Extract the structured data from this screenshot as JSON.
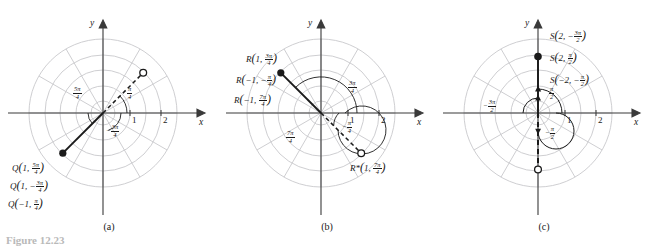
{
  "figure": {
    "caption": "Figure 12.23",
    "panels": [
      {
        "id": "a",
        "caption": "(a)",
        "axis": {
          "x_label": "x",
          "y_label": "y",
          "ticks": [
            "1",
            "2"
          ]
        },
        "angle_labels": [
          {
            "name": "five-pi-over-four",
            "sign": "",
            "num": "5π",
            "den": "4"
          },
          {
            "name": "pi-over-four",
            "sign": "",
            "num": "π",
            "den": "4"
          },
          {
            "name": "neg-three-pi-over-four",
            "sign": "−",
            "num": "3π",
            "den": "4"
          }
        ],
        "point_labels": [
          {
            "name": "Q",
            "r": "1",
            "sign": "",
            "num": "5π",
            "den": "4"
          },
          {
            "name": "Q",
            "r": "1",
            "sign": "−",
            "num": "3π",
            "den": "4"
          },
          {
            "name": "Q",
            "r": "−1",
            "sign": "",
            "num": "π",
            "den": "4"
          }
        ],
        "markers": [
          {
            "kind": "filled",
            "r": 1,
            "theta_deg": 225
          },
          {
            "kind": "open",
            "r": 1,
            "theta_deg": 45
          }
        ]
      },
      {
        "id": "b",
        "caption": "(b)",
        "axis": {
          "x_label": "x",
          "y_label": "y",
          "ticks": [
            "1",
            "2"
          ]
        },
        "angle_labels": [
          {
            "name": "three-pi-over-four",
            "sign": "",
            "num": "3π",
            "den": "4"
          },
          {
            "name": "seven-pi-over-four",
            "sign": "",
            "num": "7π",
            "den": "4"
          },
          {
            "name": "neg-pi-over-four",
            "sign": "−",
            "num": "π",
            "den": "4"
          }
        ],
        "point_labels": [
          {
            "name": "R",
            "r": "1",
            "sign": "",
            "num": "3π",
            "den": "4"
          },
          {
            "name": "R",
            "r": "−1",
            "sign": "−",
            "num": "π",
            "den": "4"
          },
          {
            "name": "R",
            "r": "−1",
            "sign": "",
            "num": "7π",
            "den": "4"
          },
          {
            "name": "R*",
            "r": "1",
            "sign": "",
            "num": "7π",
            "den": "4"
          }
        ],
        "markers": [
          {
            "kind": "filled",
            "r": 1,
            "theta_deg": 135
          },
          {
            "kind": "open",
            "r": 1,
            "theta_deg": 315
          }
        ]
      },
      {
        "id": "c",
        "caption": "(c)",
        "axis": {
          "x_label": "x",
          "y_label": "y",
          "ticks": [
            "1",
            "2"
          ]
        },
        "angle_labels": [
          {
            "name": "neg-three-pi-over-two",
            "sign": "−",
            "num": "3π",
            "den": "2"
          },
          {
            "name": "pi-over-two",
            "sign": "",
            "num": "π",
            "den": "2"
          },
          {
            "name": "neg-pi-over-two",
            "sign": "−",
            "num": "π",
            "den": "2"
          }
        ],
        "point_labels": [
          {
            "name": "S",
            "r": "2",
            "sign": "−",
            "num": "3π",
            "den": "2"
          },
          {
            "name": "S",
            "r": "2",
            "sign": "",
            "num": "π",
            "den": "2"
          },
          {
            "name": "S",
            "r": "−2",
            "sign": "−",
            "num": "π",
            "den": "2"
          }
        ],
        "markers": [
          {
            "kind": "filled",
            "r": 2,
            "theta_deg": 90
          },
          {
            "kind": "open",
            "r": 2,
            "theta_deg": 270
          }
        ]
      }
    ],
    "colors": {
      "grid": "#c8c8cc",
      "axis": "#3a3a3a",
      "ray": "#1a1a1a",
      "text": "#1a1a1a",
      "caption_gray": "#b9b9b9"
    }
  }
}
